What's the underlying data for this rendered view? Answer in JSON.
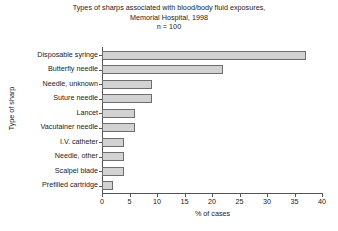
{
  "chart_data": {
    "type": "bar",
    "orientation": "horizontal",
    "title": "Types of sharps associated with blood/body fluid exposures,",
    "subtitle": "Memorial Hospital, 1998",
    "annotation": "n = 100",
    "xlabel": "% of cases",
    "ylabel": "Type of sharp",
    "xlim": [
      0,
      40
    ],
    "xticks": [
      0,
      5,
      10,
      15,
      20,
      25,
      30,
      35,
      40
    ],
    "grid": false,
    "legend": null,
    "categories": [
      "Prefilled cartridge",
      "Scalpel blade",
      "Needle, other",
      "I.V. catheter",
      "Vacutainer needle",
      "Lancet",
      "Suture needle",
      "Needle, unknown",
      "Butterfly needle",
      "Disposable syringe"
    ],
    "values": [
      2,
      4,
      4,
      4,
      6,
      6,
      9,
      9,
      22,
      37
    ],
    "bar_fill_color": "#d2d2d2",
    "bar_border_color": "#6e6e6e",
    "axis_color": "#555555",
    "text_color": "#1a1a1a",
    "background_color": "#ffffff"
  }
}
